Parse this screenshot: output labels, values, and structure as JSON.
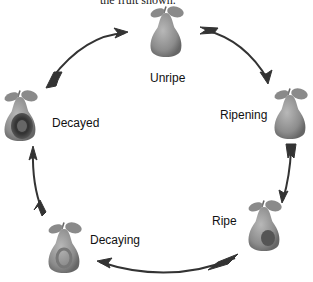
{
  "caption_fragment": "the fruit shown.",
  "stages": [
    {
      "id": "unripe",
      "label": "Unripe"
    },
    {
      "id": "ripening",
      "label": "Ripening"
    },
    {
      "id": "ripe",
      "label": "Ripe"
    },
    {
      "id": "decaying",
      "label": "Decaying"
    },
    {
      "id": "decayed",
      "label": "Decayed"
    }
  ],
  "cycle_direction": "clockwise",
  "colors": {
    "arrow": "#333333",
    "pear_light": "#9a9a9a",
    "pear_dark": "#555555",
    "leaf": "#8a8a8a"
  }
}
